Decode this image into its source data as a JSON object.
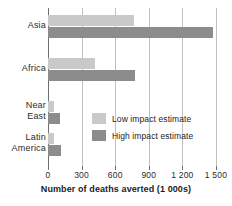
{
  "chart_data": {
    "type": "bar",
    "orientation": "horizontal",
    "title": "",
    "xlabel": "Number of deaths averted (1 000s)",
    "ylabel": "",
    "categories": [
      "Asia",
      "Africa",
      "Near East",
      "Latin America"
    ],
    "category_label_lines": [
      [
        "Asia"
      ],
      [
        "Africa"
      ],
      [
        "Near",
        "East"
      ],
      [
        "Latin",
        "America"
      ]
    ],
    "series": [
      {
        "name": "Low impact estimate",
        "color": "#c9c9c9",
        "values": [
          770,
          420,
          55,
          55
        ]
      },
      {
        "name": "High impact estimate",
        "color": "#8c8c8c",
        "values": [
          1470,
          780,
          110,
          115
        ]
      }
    ],
    "xlim": [
      0,
      1500
    ],
    "xticks": [
      0,
      300,
      600,
      900,
      1200,
      1500
    ],
    "xtick_labels": [
      "0",
      "300",
      "600",
      "900",
      "1 200",
      "1 500"
    ],
    "grid": true,
    "grid_axis": "x",
    "legend_position": "center-right-inside"
  },
  "legend": {
    "items": [
      {
        "label": "Low impact estimate"
      },
      {
        "label": "High impact estimate"
      }
    ]
  },
  "axis": {
    "x_title": "Number of deaths averted (1 000s)"
  },
  "colors": {
    "low": "#c9c9c9",
    "high": "#8c8c8c",
    "grid": "#c0c0c0",
    "axis": "#6e6e6e",
    "text": "#1d1d1d",
    "background": "#ffffff"
  }
}
